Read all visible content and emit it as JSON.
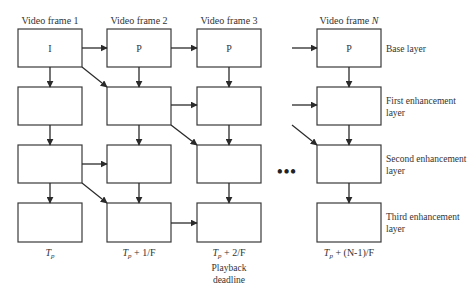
{
  "diagram": {
    "frames": [
      {
        "label": "Video frame 1",
        "base_type": "I",
        "time_label": {
          "var": "T",
          "sub": "p",
          "suffix": ""
        }
      },
      {
        "label": "Video frame 2",
        "base_type": "P",
        "time_label": {
          "var": "T",
          "sub": "p",
          "suffix": " + 1/F"
        }
      },
      {
        "label": "Video frame 3",
        "base_type": "P",
        "time_label": {
          "var": "T",
          "sub": "p",
          "suffix": " + 2/F"
        }
      },
      {
        "label": "Video frame N",
        "base_type": "P",
        "time_label": {
          "var": "T",
          "sub": "p",
          "suffix": " + (N-1)/F"
        }
      }
    ],
    "layers": [
      {
        "name": "Base layer"
      },
      {
        "name": "First enhancement layer"
      },
      {
        "name": "Second enhancement layer"
      },
      {
        "name": "Third enhancement layer"
      }
    ],
    "playback_deadline": {
      "line1": "Playback",
      "line2": "deadline",
      "under_frame": 3
    },
    "ellipsis": "•••",
    "colors": {
      "stroke": "#3a3a3a",
      "text": "#333333",
      "background": "#ffffff"
    },
    "edges": [
      {
        "from": "F1-L0",
        "to": "F2-L0",
        "kind": "horizontal"
      },
      {
        "from": "F2-L0",
        "to": "F3-L0",
        "kind": "horizontal"
      },
      {
        "from": "...",
        "to": "FN-L0",
        "kind": "horizontal"
      },
      {
        "from": "F1-L0",
        "to": "F1-L1",
        "kind": "vertical"
      },
      {
        "from": "F2-L0",
        "to": "F2-L1",
        "kind": "vertical"
      },
      {
        "from": "F3-L0",
        "to": "F3-L1",
        "kind": "vertical"
      },
      {
        "from": "FN-L0",
        "to": "FN-L1",
        "kind": "vertical"
      },
      {
        "from": "F1-L0",
        "to": "F2-L1",
        "kind": "diagonal"
      },
      {
        "from": "F2-L1",
        "to": "F3-L1",
        "kind": "horizontal"
      },
      {
        "from": "...",
        "to": "FN-L1",
        "kind": "horizontal"
      },
      {
        "from": "F1-L1",
        "to": "F1-L2",
        "kind": "vertical"
      },
      {
        "from": "F2-L1",
        "to": "F2-L2",
        "kind": "vertical"
      },
      {
        "from": "F3-L1",
        "to": "F3-L2",
        "kind": "vertical"
      },
      {
        "from": "FN-L1",
        "to": "FN-L2",
        "kind": "vertical"
      },
      {
        "from": "F2-L1",
        "to": "F3-L2",
        "kind": "diagonal"
      },
      {
        "from": "...",
        "to": "FN-L2",
        "kind": "diagonal"
      },
      {
        "from": "F1-L2",
        "to": "F2-L2",
        "kind": "horizontal"
      },
      {
        "from": "F1-L2",
        "to": "F1-L3",
        "kind": "vertical"
      },
      {
        "from": "F2-L2",
        "to": "F2-L3",
        "kind": "vertical"
      },
      {
        "from": "F3-L2",
        "to": "F3-L3",
        "kind": "vertical"
      },
      {
        "from": "FN-L2",
        "to": "FN-L3",
        "kind": "vertical"
      },
      {
        "from": "F1-L2",
        "to": "F2-L3",
        "kind": "diagonal"
      },
      {
        "from": "F2-L3",
        "to": "F3-L3",
        "kind": "horizontal"
      }
    ]
  }
}
